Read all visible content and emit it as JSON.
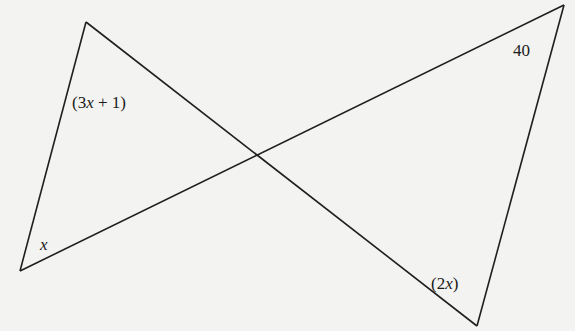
{
  "diagram": {
    "type": "bowtie-triangles",
    "line_color": "#1f1f1f",
    "background": "#f3f3f1",
    "vertices": {
      "top_left": [
        86,
        22
      ],
      "bottom_left": [
        20,
        271
      ],
      "top_right": [
        564,
        5
      ],
      "bottom_right": [
        477,
        326
      ]
    },
    "intersection": [
      258,
      158
    ],
    "labels": {
      "top_left_angle": "(3x + 1)",
      "bottom_left_angle": "x",
      "top_right_angle": "40",
      "bottom_right_angle": "(2x)"
    }
  }
}
